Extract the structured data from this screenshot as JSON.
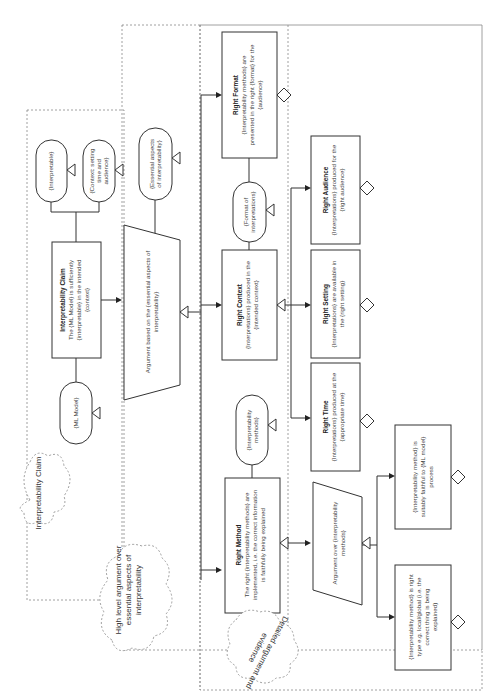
{
  "regions": {
    "interpretability_claim": "Interpretability Claim",
    "high_level_argument": [
      "High level argument over",
      "essential aspects of",
      "interpretability"
    ],
    "detailed_argument": [
      "Detailed argument and",
      "evidence"
    ]
  },
  "nodes": {
    "claim": {
      "title": "Interpretability Claim",
      "lines": [
        "The {ML Model} is sufficiently",
        "{interpretable} in the intended",
        "{context}"
      ]
    },
    "ml_model": {
      "lines": [
        "{ML Model}"
      ]
    },
    "interpretable": {
      "lines": [
        "{Interpretable}"
      ]
    },
    "context_ctx": {
      "lines": [
        "{Context: setting",
        "time and",
        "audience}"
      ]
    },
    "argument_essential": {
      "lines": [
        "Argument based on the {essential aspects of",
        "interpretability}"
      ]
    },
    "essential_ctx": {
      "lines": [
        "{Essential aspects",
        "of interpretability}"
      ]
    },
    "right_format": {
      "title": "Right Format",
      "lines": [
        "{Interpretability methods} are",
        "presented in the right {format} for the",
        "{audience}"
      ]
    },
    "format_ctx": {
      "lines": [
        "{Format of",
        "interpretations}"
      ]
    },
    "right_context": {
      "title": "Right  Context",
      "lines": [
        "{Interpretations} produced in the",
        "{intended context}"
      ]
    },
    "methods_ctx": {
      "lines": [
        "{Interpretability",
        "methods}"
      ]
    },
    "right_method": {
      "title": "Right Method",
      "lines": [
        "The right {interpretability methods} are",
        "implemented, i.e. the correct information",
        "is faithfully being explained"
      ]
    },
    "right_audience": {
      "title": "Right Audience",
      "lines": [
        "{Interpretations} produced for the",
        "{right audience}"
      ]
    },
    "right_setting": {
      "title": "Right Setting",
      "lines": [
        "{Interpretations} are available in",
        "the {right setting}"
      ]
    },
    "right_time": {
      "title": "Right Time",
      "lines": [
        "{Interpretations} produced at the",
        "{appropriate time}"
      ]
    },
    "argument_methods": {
      "lines": [
        "Argument over {interpretability",
        "methods}"
      ]
    },
    "faithful": {
      "lines": [
        "{Interpretability method} is",
        "suitably faithful to {ML model}",
        "process"
      ]
    },
    "right_type": {
      "lines": [
        "{Interpretability method} is right",
        "type e.g. local/global (i.e. the",
        "correct thing is being",
        "explained)"
      ]
    }
  }
}
